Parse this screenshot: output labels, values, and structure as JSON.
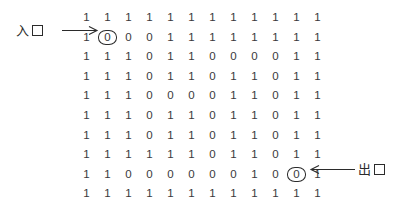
{
  "figure": {
    "rows": 10,
    "cols": 12,
    "wall_value": "1",
    "path_value": "0",
    "ink_color": "#2b2b2b",
    "background_color": "#ffffff"
  },
  "chart_data": {
    "type": "table",
    "title": "",
    "xlabel": "",
    "ylabel": "",
    "grid": [
      [
        "1",
        "1",
        "1",
        "1",
        "1",
        "1",
        "1",
        "1",
        "1",
        "1",
        "1",
        "1"
      ],
      [
        "1",
        "0",
        "0",
        "0",
        "1",
        "1",
        "1",
        "1",
        "1",
        "1",
        "1",
        "1"
      ],
      [
        "1",
        "1",
        "1",
        "0",
        "1",
        "1",
        "0",
        "0",
        "0",
        "0",
        "1",
        "1"
      ],
      [
        "1",
        "1",
        "1",
        "0",
        "1",
        "1",
        "0",
        "1",
        "1",
        "0",
        "1",
        "1"
      ],
      [
        "1",
        "1",
        "1",
        "0",
        "0",
        "0",
        "0",
        "1",
        "1",
        "0",
        "1",
        "1"
      ],
      [
        "1",
        "1",
        "1",
        "0",
        "1",
        "1",
        "0",
        "1",
        "1",
        "0",
        "1",
        "1"
      ],
      [
        "1",
        "1",
        "1",
        "0",
        "1",
        "1",
        "0",
        "1",
        "1",
        "0",
        "1",
        "1"
      ],
      [
        "1",
        "1",
        "1",
        "1",
        "1",
        "1",
        "0",
        "1",
        "1",
        "0",
        "1",
        "1"
      ],
      [
        "1",
        "1",
        "0",
        "0",
        "0",
        "0",
        "0",
        "0",
        "1",
        "0",
        "0",
        "1"
      ],
      [
        "1",
        "1",
        "1",
        "1",
        "1",
        "1",
        "1",
        "1",
        "1",
        "1",
        "1",
        "1"
      ]
    ],
    "marked_cells": [
      {
        "row": 1,
        "col": 1,
        "role": "entrance",
        "value": "0"
      },
      {
        "row": 8,
        "col": 10,
        "role": "exit",
        "value": "0"
      }
    ]
  },
  "entry_label": {
    "text": "入",
    "box_glyph": "口",
    "name": "entrance"
  },
  "exit_label": {
    "text": "出",
    "box_glyph": "口",
    "name": "exit"
  }
}
